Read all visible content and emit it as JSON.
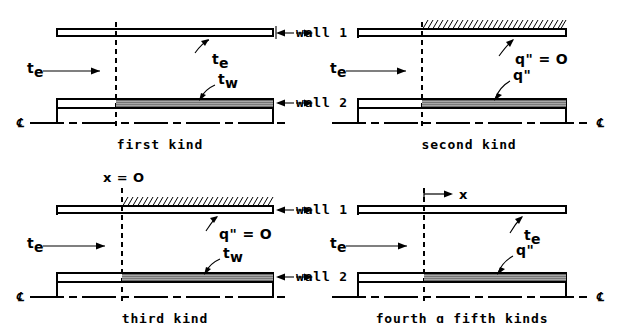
{
  "figure": {
    "colors": {
      "line": "#000000",
      "shading": "#6b6b6b",
      "background": "#ffffff"
    }
  },
  "panels": [
    {
      "id": "first-kind",
      "caption": "first  kind",
      "labels": {
        "inlet_temp": "t",
        "inlet_temp_sub": "e",
        "wall1_label": "wall 1",
        "wall2_label": "wall 2",
        "upper_annotation": "t",
        "upper_annotation_sub": "e",
        "lower_annotation": "t",
        "lower_annotation_sub": "w",
        "centerline_left": "℄",
        "centerline_right": ""
      }
    },
    {
      "id": "second-kind",
      "caption": "second  kind",
      "labels": {
        "inlet_temp": "t",
        "inlet_temp_sub": "e",
        "wall1_label": "wall 1",
        "wall2_label": "wall 2",
        "upper_annotation": "q\" = O",
        "upper_annotation_sub": "",
        "lower_annotation": "q\"",
        "lower_annotation_sub": "",
        "centerline_left": "",
        "centerline_right": "℄"
      }
    },
    {
      "id": "third-kind",
      "caption": "third  kind",
      "labels": {
        "inlet_temp": "t",
        "inlet_temp_sub": "e",
        "wall1_label": "wall 1",
        "wall2_label": "wall 2",
        "upper_annotation": "q\" = O",
        "upper_annotation_sub": "",
        "lower_annotation": "t",
        "lower_annotation_sub": "w",
        "origin_label": "x = O",
        "centerline_left": "℄",
        "centerline_right": ""
      }
    },
    {
      "id": "fourth-fifth-kinds",
      "caption": "fourth ɑ fifth kinds",
      "labels": {
        "inlet_temp": "t",
        "inlet_temp_sub": "e",
        "wall1_label": "wall 1",
        "wall2_label": "wall 2",
        "upper_annotation": "t",
        "upper_annotation_sub": "e",
        "lower_annotation": "q\"",
        "lower_annotation_sub": "",
        "axis_label": "x",
        "centerline_left": "",
        "centerline_right": "℄"
      }
    }
  ]
}
